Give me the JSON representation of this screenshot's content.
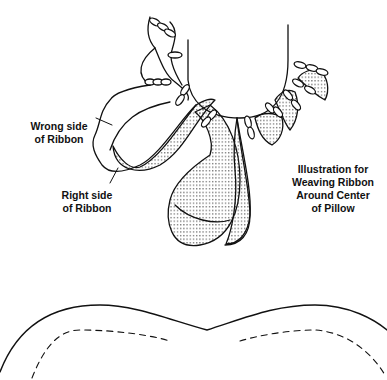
{
  "diagram": {
    "title_lines": [
      "Illustration for",
      "Weaving Ribbon",
      "Around Center",
      "of Pillow"
    ],
    "labels": {
      "wrong_side": [
        "Wrong side",
        "of Ribbon"
      ],
      "right_side": [
        "Right side",
        "of Ribbon"
      ]
    },
    "colors": {
      "line": "#111111",
      "background": "#ffffff",
      "stipple": "#333333"
    },
    "parts": [
      "ribbon-loops",
      "pillow-outline",
      "stitching-line"
    ]
  }
}
